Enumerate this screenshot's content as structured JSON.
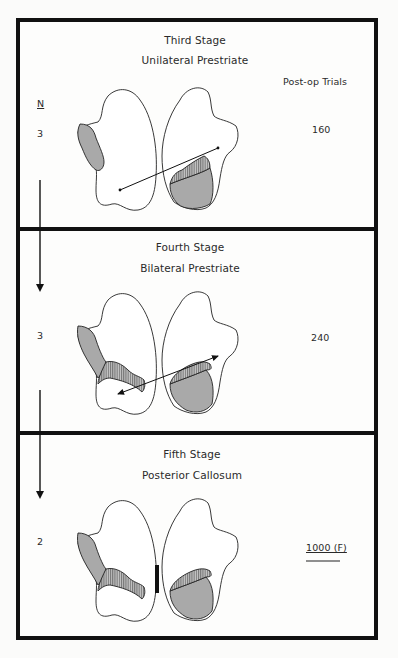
{
  "figure": {
    "column_headers": {
      "n": "N",
      "post_op_trials": "Post-op Trials"
    },
    "stages": [
      {
        "title": "Third Stage",
        "lesion": "Unilateral Prestriate",
        "n": "3",
        "post_op_trials": "160",
        "callosum_marker": false
      },
      {
        "title": "Fourth Stage",
        "lesion": "Bilateral Prestriate",
        "n": "3",
        "post_op_trials": "240",
        "callosum_marker": false
      },
      {
        "title": "Fifth Stage",
        "lesion": "Posterior Callosum",
        "n": "2",
        "post_op_trials": "1000 (F)",
        "failure_marker": "double-underline",
        "callosum_marker": true
      }
    ],
    "legend_patterns": {
      "gray_fill": "#a9a9a9",
      "hatched_fill": "vertical-hatch",
      "outline": "#222222"
    }
  }
}
